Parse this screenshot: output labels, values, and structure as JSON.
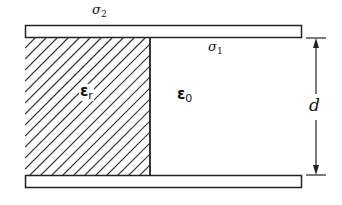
{
  "diagram": {
    "type": "parallel-plate capacitor partially filled with dielectric",
    "labels": {
      "sigma2": {
        "base": "σ",
        "sub": "2"
      },
      "sigma1": {
        "base": "σ",
        "sub": "1"
      },
      "eps_r": {
        "base": "ε",
        "sub": "r"
      },
      "eps_0": {
        "base": "ε",
        "sub": "0"
      },
      "d": "d"
    },
    "regions": [
      {
        "name": "dielectric",
        "label": "εr",
        "fill": "hatched"
      },
      {
        "name": "vacuum",
        "label": "ε0",
        "fill": "none"
      }
    ],
    "colors": {
      "stroke": "#222222",
      "background": "#ffffff"
    }
  }
}
